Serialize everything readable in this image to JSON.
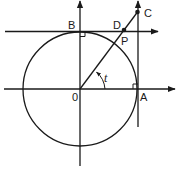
{
  "diagram": {
    "labels": {
      "origin": "0",
      "A": "A",
      "B": "B",
      "C": "C",
      "D": "D",
      "P": "P",
      "angle": "t"
    },
    "colors": {
      "stroke": "#1a1a1a",
      "background": "#ffffff"
    }
  }
}
